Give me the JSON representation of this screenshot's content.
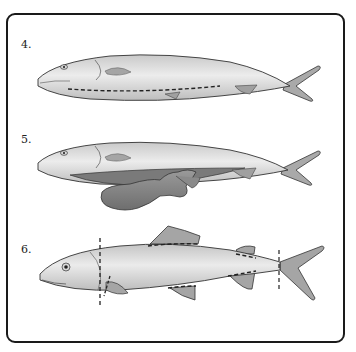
{
  "figure": {
    "type": "instructional-diagram",
    "steps": [
      {
        "label": "4.",
        "description": "fish with dashed cut line along belly"
      },
      {
        "label": "5.",
        "description": "fish with belly opened and entrails removed"
      },
      {
        "label": "6.",
        "description": "fish with dashed cut lines behind head, at tail, and around fins"
      }
    ],
    "colors": {
      "outline": "#333333",
      "body_light": "#e6e6e6",
      "body_dark": "#a8a8a8",
      "fin": "#9a9a9a",
      "entrails": "#7d7d7d",
      "frame": "#1a1a1a"
    }
  }
}
